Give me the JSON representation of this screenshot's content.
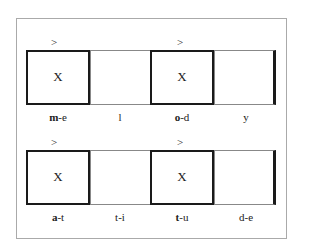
{
  "rows": [
    {
      "groups": [
        {
          "arrow": ">",
          "box_symbol": "X",
          "label_bold": "m",
          "label_rest": "-e",
          "cell_label": "l"
        },
        {
          "arrow": ">",
          "box_symbol": "X",
          "label_bold": "o",
          "label_rest": "-d",
          "cell_label": "y"
        }
      ]
    },
    {
      "groups": [
        {
          "arrow": ">",
          "box_symbol": "X",
          "label_bold": "a",
          "label_rest": "-t",
          "cell_label": "t-i"
        },
        {
          "arrow": ">",
          "box_symbol": "X",
          "label_bold": "t",
          "label_rest": "-u",
          "cell_label": "d-e"
        }
      ]
    }
  ]
}
